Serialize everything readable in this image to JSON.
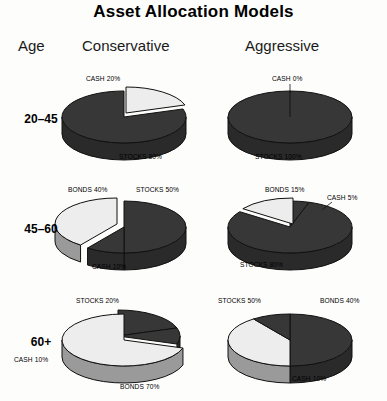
{
  "title": "Asset Allocation Models",
  "headers": {
    "age": "Age",
    "conservative": "Conservative",
    "aggressive": "Aggressive"
  },
  "colors": {
    "dark": "#373737",
    "light": "#ededed",
    "outline": "#111111",
    "side_dark": "#2a2a2a",
    "side_light": "#9a9a9a",
    "background": "#fdfdfb"
  },
  "rows": [
    {
      "age_label": "20–45",
      "charts": [
        {
          "model": "Conservative",
          "labels": [
            {
              "text": "CASH 20%",
              "x": 86,
              "y": 74
            },
            {
              "text": "STOCKS 80%",
              "x": 119,
              "y": 152
            }
          ],
          "slices": [
            {
              "name": "CASH",
              "value": 20,
              "shade": "light",
              "label": "CASH 20%"
            },
            {
              "name": "STOCKS",
              "value": 80,
              "shade": "dark",
              "label": "STOCKS 80%"
            }
          ]
        },
        {
          "model": "Aggressive",
          "labels": [
            {
              "text": "CASH 0%",
              "x": 272,
              "y": 74
            },
            {
              "text": "STOCKS 100%",
              "x": 255,
              "y": 152
            }
          ],
          "slices": [
            {
              "name": "CASH",
              "value": 0,
              "shade": "light",
              "label": "CASH 0%"
            },
            {
              "name": "STOCKS",
              "value": 100,
              "shade": "dark",
              "label": "STOCKS 100%"
            }
          ]
        }
      ]
    },
    {
      "age_label": "45–60",
      "charts": [
        {
          "model": "Conservative",
          "labels": [
            {
              "text": "BONDS 40%",
              "x": 68,
              "y": 185
            },
            {
              "text": "STOCKS 50%",
              "x": 136,
              "y": 185
            },
            {
              "text": "CASH 10%",
              "x": 92,
              "y": 262
            }
          ],
          "slices": [
            {
              "name": "STOCKS",
              "value": 50,
              "shade": "dark",
              "label": "STOCKS 50%"
            },
            {
              "name": "CASH",
              "value": 10,
              "shade": "dark",
              "label": "CASH 10%"
            },
            {
              "name": "BONDS",
              "value": 40,
              "shade": "light",
              "label": "BONDS 40%"
            }
          ]
        },
        {
          "model": "Aggressive",
          "labels": [
            {
              "text": "BONDS 15%",
              "x": 265,
              "y": 185
            },
            {
              "text": "CASH 5%",
              "x": 327,
              "y": 193
            },
            {
              "text": "STOCKS 80%",
              "x": 240,
              "y": 260
            }
          ],
          "slices": [
            {
              "name": "CASH",
              "value": 5,
              "shade": "dark",
              "label": "CASH 5%"
            },
            {
              "name": "STOCKS",
              "value": 80,
              "shade": "dark",
              "label": "STOCKS 80%"
            },
            {
              "name": "BONDS",
              "value": 15,
              "shade": "light",
              "label": "BONDS 15%"
            }
          ]
        }
      ]
    },
    {
      "age_label": "60+",
      "charts": [
        {
          "model": "Conservative",
          "labels": [
            {
              "text": "STOCKS 20%",
              "x": 76,
              "y": 296
            },
            {
              "text": "CASH 10%",
              "x": 14,
              "y": 355
            },
            {
              "text": "BONDS 70%",
              "x": 120,
              "y": 382
            }
          ],
          "slices": [
            {
              "name": "STOCKS",
              "value": 20,
              "shade": "dark",
              "label": "STOCKS 20%"
            },
            {
              "name": "CASH",
              "value": 10,
              "shade": "dark",
              "label": "CASH 10%"
            },
            {
              "name": "BONDS",
              "value": 70,
              "shade": "light",
              "label": "BONDS 70%"
            }
          ]
        },
        {
          "model": "Aggressive",
          "labels": [
            {
              "text": "STOCKS 50%",
              "x": 218,
              "y": 296
            },
            {
              "text": "BONDS 40%",
              "x": 320,
              "y": 296
            },
            {
              "text": "CASH 10%",
              "x": 292,
              "y": 374
            }
          ],
          "slices": [
            {
              "name": "STOCKS",
              "value": 50,
              "shade": "dark",
              "label": "STOCKS 50%"
            },
            {
              "name": "BONDS",
              "value": 40,
              "shade": "light",
              "label": "BONDS 40%"
            },
            {
              "name": "CASH",
              "value": 10,
              "shade": "dark",
              "label": "CASH 10%"
            }
          ]
        }
      ]
    }
  ],
  "chart_data": {
    "type": "pie",
    "title": "Asset Allocation Models",
    "categories": [
      "CASH",
      "STOCKS",
      "BONDS"
    ],
    "legend_position": "none",
    "charts": [
      {
        "age": "20–45",
        "model": "Conservative",
        "labels": [
          "CASH",
          "STOCKS"
        ],
        "values": [
          20,
          80
        ]
      },
      {
        "age": "20–45",
        "model": "Aggressive",
        "labels": [
          "CASH",
          "STOCKS"
        ],
        "values": [
          0,
          100
        ]
      },
      {
        "age": "45–60",
        "model": "Conservative",
        "labels": [
          "STOCKS",
          "CASH",
          "BONDS"
        ],
        "values": [
          50,
          10,
          40
        ]
      },
      {
        "age": "45–60",
        "model": "Aggressive",
        "labels": [
          "CASH",
          "STOCKS",
          "BONDS"
        ],
        "values": [
          5,
          80,
          15
        ]
      },
      {
        "age": "60+",
        "model": "Conservative",
        "labels": [
          "STOCKS",
          "CASH",
          "BONDS"
        ],
        "values": [
          20,
          10,
          70
        ]
      },
      {
        "age": "60+",
        "model": "Aggressive",
        "labels": [
          "STOCKS",
          "BONDS",
          "CASH"
        ],
        "values": [
          50,
          40,
          10
        ]
      }
    ]
  },
  "geometry": {
    "pie_rx": 62,
    "pie_ry": 26,
    "depth": 17,
    "centers": [
      {
        "cx": 124,
        "cy": 117
      },
      {
        "cx": 290,
        "cy": 117
      },
      {
        "cx": 124,
        "cy": 227
      },
      {
        "cx": 290,
        "cy": 227
      },
      {
        "cx": 124,
        "cy": 340
      },
      {
        "cx": 290,
        "cy": 340
      }
    ],
    "age_label_y": [
      112,
      222,
      335
    ]
  }
}
